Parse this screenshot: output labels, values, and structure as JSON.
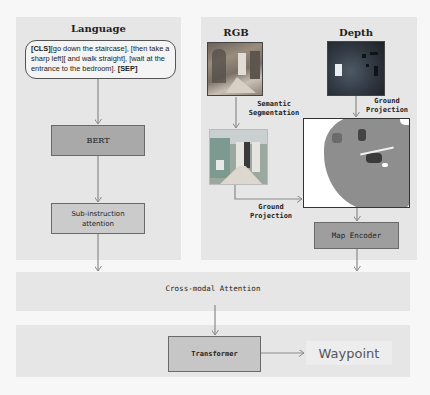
{
  "language_panel": {
    "title": "Language",
    "instruction_tokens": {
      "cls": "[CLS]",
      "text": "[go down the staircase], [then take a sharp left][ and walk straight], [wait at the entrance to the bedroom]. ",
      "sep": "[SEP]"
    },
    "bert_label": "BERT",
    "subinstruction_label_line1": "Sub-instruction",
    "subinstruction_label_line2": "attention"
  },
  "vision_panel": {
    "rgb_title": "RGB",
    "depth_title": "Depth",
    "semantic_seg_label_line1": "Semantic",
    "semantic_seg_label_line2": "Segmentation",
    "ground_projection_depth_line1": "Ground",
    "ground_projection_depth_line2": "Projection",
    "ground_projection_seg_line1": "Ground",
    "ground_projection_seg_line2": "Projection",
    "map_encoder_label": "Map Encoder"
  },
  "fusion": {
    "cross_modal_label": "Cross-modal Attention",
    "transformer_label": "Transformer",
    "output_label": "Waypoint"
  },
  "colors": {
    "panel_bg": "#e6e6e6",
    "dark_box": "#a9a9a9",
    "light_box": "#cbcbcb",
    "arrow": "#8a8a8a"
  }
}
